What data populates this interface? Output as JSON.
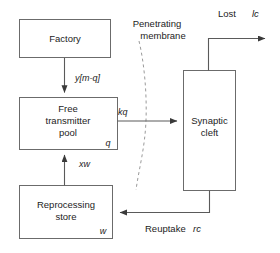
{
  "diagram": {
    "boxes": {
      "factory": {
        "label": "Factory"
      },
      "free_pool": {
        "line1": "Free",
        "line2": "transmitter",
        "line3": "pool",
        "variable": "q"
      },
      "reprocessing": {
        "line1": "Reprocessing",
        "line2": "store",
        "variable": "w"
      },
      "synaptic_cleft": {
        "line1": "Synaptic",
        "line2": "cleft"
      }
    },
    "edges": {
      "factory_to_pool": "y[m-q]",
      "pool_to_cleft": "kq",
      "store_to_pool": "xw",
      "cleft_lost_name": "Lost",
      "cleft_lost_rate": "lc",
      "cleft_to_store_name": "Reuptake",
      "cleft_to_store_rate": "rc"
    },
    "annotations": {
      "membrane_line1": "Penetrating",
      "membrane_line2": "membrane"
    },
    "colors": {
      "background": "#ffffff",
      "box_stroke": "#6b6b6b",
      "line_stroke": "#5a5a5a",
      "membrane_stroke": "#9a9a9a",
      "text": "#1c1c1c"
    }
  }
}
